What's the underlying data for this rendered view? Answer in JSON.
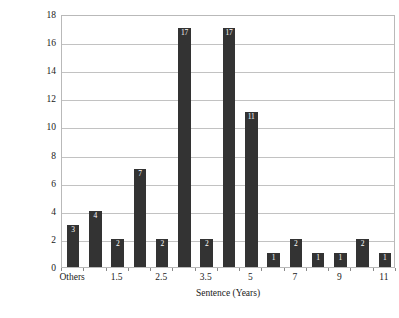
{
  "chart_data": {
    "type": "bar",
    "title": "",
    "xlabel": "Sentence (Years)",
    "ylabel": "No. of Persons",
    "ylim": [
      0,
      18
    ],
    "y_ticks": [
      0,
      2,
      4,
      6,
      8,
      10,
      12,
      14,
      16,
      18
    ],
    "grid": true,
    "legend": false,
    "bar_color": "#333333",
    "value_label_color": "#ffffff",
    "gridline_color": "#c2c2c2",
    "frame_color": "#b9b9b9",
    "categories": [
      "Others",
      "",
      "1.5",
      "",
      "2.5",
      "",
      "3.5",
      "",
      "5",
      "",
      "7",
      "",
      "9",
      "",
      "11"
    ],
    "x_tick_labels": [
      {
        "index": 0,
        "label": "Others"
      },
      {
        "index": 2,
        "label": "1.5"
      },
      {
        "index": 4,
        "label": "2.5"
      },
      {
        "index": 6,
        "label": "3.5"
      },
      {
        "index": 8,
        "label": "5"
      },
      {
        "index": 10,
        "label": "7"
      },
      {
        "index": 12,
        "label": "9"
      },
      {
        "index": 14,
        "label": "11"
      }
    ],
    "values": [
      3,
      4,
      2,
      7,
      2,
      17,
      2,
      17,
      11,
      1,
      2,
      1,
      1,
      2,
      1
    ],
    "value_labels": [
      "3",
      "4",
      "2",
      "7",
      "2",
      "17",
      "2",
      "17",
      "11",
      "1",
      "2",
      "1",
      "1",
      "2",
      "1"
    ]
  }
}
